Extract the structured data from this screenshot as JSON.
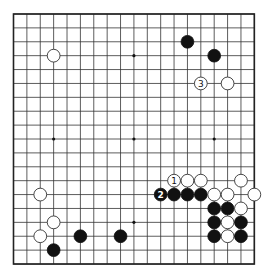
{
  "diagram": {
    "type": "go-board",
    "size": 19,
    "geometry": {
      "origin_x": 13.5,
      "origin_y": 14,
      "col_spacing": 13.38,
      "row_spacing": 13.89,
      "stone_radius": 6.4
    },
    "colors": {
      "background": "#ffffff",
      "line": "#333333",
      "black_stone": "#111111",
      "white_stone": "#ffffff"
    },
    "star_points": [
      [
        3,
        3
      ],
      [
        9,
        3
      ],
      [
        15,
        3
      ],
      [
        3,
        9
      ],
      [
        9,
        9
      ],
      [
        15,
        9
      ],
      [
        3,
        15
      ],
      [
        9,
        15
      ],
      [
        15,
        15
      ]
    ],
    "stones": [
      {
        "color": "white",
        "col": 3,
        "row": 3
      },
      {
        "color": "black",
        "col": 13,
        "row": 2
      },
      {
        "color": "black",
        "col": 15,
        "row": 3
      },
      {
        "color": "white",
        "col": 14,
        "row": 5,
        "label": "3"
      },
      {
        "color": "white",
        "col": 16,
        "row": 5
      },
      {
        "color": "white",
        "col": 2,
        "row": 13
      },
      {
        "color": "white",
        "col": 3,
        "row": 15
      },
      {
        "color": "white",
        "col": 2,
        "row": 16
      },
      {
        "color": "black",
        "col": 3,
        "row": 17
      },
      {
        "color": "black",
        "col": 5,
        "row": 16
      },
      {
        "color": "black",
        "col": 8,
        "row": 16
      },
      {
        "color": "white",
        "col": 12,
        "row": 12,
        "label": "1"
      },
      {
        "color": "white",
        "col": 13,
        "row": 12
      },
      {
        "color": "white",
        "col": 14,
        "row": 12
      },
      {
        "color": "white",
        "col": 17,
        "row": 12
      },
      {
        "color": "black",
        "col": 11,
        "row": 13,
        "label": "2"
      },
      {
        "color": "black",
        "col": 12,
        "row": 13
      },
      {
        "color": "black",
        "col": 13,
        "row": 13
      },
      {
        "color": "black",
        "col": 14,
        "row": 13
      },
      {
        "color": "white",
        "col": 15,
        "row": 13
      },
      {
        "color": "white",
        "col": 16,
        "row": 13
      },
      {
        "color": "white",
        "col": 18,
        "row": 13
      },
      {
        "color": "black",
        "col": 15,
        "row": 14
      },
      {
        "color": "black",
        "col": 16,
        "row": 14
      },
      {
        "color": "white",
        "col": 17,
        "row": 14
      },
      {
        "color": "black",
        "col": 15,
        "row": 15
      },
      {
        "color": "white",
        "col": 16,
        "row": 15
      },
      {
        "color": "black",
        "col": 17,
        "row": 15
      },
      {
        "color": "black",
        "col": 15,
        "row": 16
      },
      {
        "color": "white",
        "col": 16,
        "row": 16
      },
      {
        "color": "black",
        "col": 17,
        "row": 16
      }
    ]
  }
}
